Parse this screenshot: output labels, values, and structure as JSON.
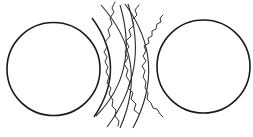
{
  "diagram": {
    "title": "",
    "colors": {
      "background": "#ffffff",
      "stroke": "#1a1a1a"
    },
    "circles": [
      {
        "name": "left-body",
        "cx": 53.5,
        "cy": 69,
        "r": 46.5
      },
      {
        "name": "right-body",
        "cx": 203.5,
        "cy": 66.5,
        "r": 46.5
      }
    ],
    "arcs": [
      {
        "name": "arc-1",
        "d": "M92,18 Q128,67 94,117",
        "thick": true
      },
      {
        "name": "arc-2",
        "d": "M101,5 Q150,60 120,128"
      },
      {
        "name": "arc-3",
        "d": "M125,4 Q168,62 133,128"
      },
      {
        "name": "arc-4",
        "d": "M107,127 Q150,70 128,4"
      },
      {
        "name": "arc-5",
        "d": "M96,116 Q140,72 120,5"
      }
    ],
    "waves": [
      {
        "name": "wave-1",
        "d": "M115,2 L112,8 L114,12 L110,18 L112,24 L108,30 L110,36 L105,42 L107,47 L104,52 L107,57 L105,62 L108,67 L106,72 L109,77 L107,83 L111,88 L109,94 L113,100 L112,106 L116,110 L115,116 L119,121 L118,126"
      },
      {
        "name": "wave-2",
        "d": "M139,5 L135,10 L137,15 L132,20 L134,25 L129,30 L131,36 L126,41 L129,47 L125,52 L128,58 L124,64 L128,70 L126,76 L130,82 L128,88 L133,93 L131,99 L136,104 L134,110 L139,114"
      },
      {
        "name": "wave-3",
        "d": "M163,15 L160,18 L161,22 L157,24 L156,29 L152,31 L152,36 L148,38 L149,43 L144,46 L146,51 L143,56 L146,61 L142,66 L145,71 L143,77 L146,82 L145,88 L148,93 L147,99 L151,103 L153,108 L157,109 L160,114 L163,117"
      }
    ]
  }
}
